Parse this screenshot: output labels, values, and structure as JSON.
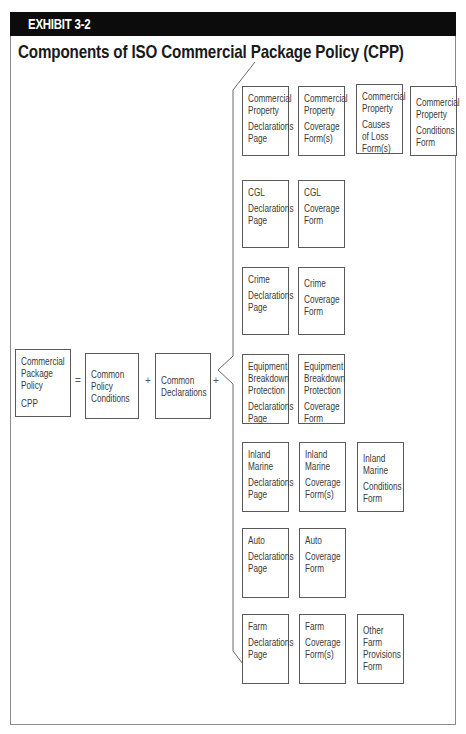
{
  "exhibit": {
    "label": "EXHIBIT 3-2"
  },
  "title": "Components of ISO Commercial Package Policy (CPP)",
  "equation": {
    "cpp": {
      "lines": [
        "Commercial",
        "Package",
        "Policy"
      ],
      "abbr": "CPP"
    },
    "equals": "=",
    "conditions": {
      "lines": [
        "Common",
        "Policy",
        "Conditions"
      ]
    },
    "plus1": "+",
    "declarations": {
      "lines": [
        "Common",
        "Declarations"
      ]
    },
    "plus2": "+"
  },
  "rows": [
    {
      "name": "commercial-property",
      "boxes": [
        {
          "head": [
            "Commercial",
            "Property"
          ],
          "body": [
            "Declarations",
            "Page"
          ]
        },
        {
          "head": [
            "Commercial",
            "Property"
          ],
          "body": [
            "Coverage",
            "Form(s)"
          ]
        },
        {
          "head": [
            "Commercial",
            "Property"
          ],
          "body": [
            "Causes",
            "of Loss",
            "Form(s)"
          ]
        },
        {
          "head": [
            "Commercial",
            "Property"
          ],
          "body": [
            "Conditions",
            "Form"
          ]
        }
      ]
    },
    {
      "name": "cgl",
      "boxes": [
        {
          "head": [
            "CGL"
          ],
          "body": [
            "Declarations",
            "Page"
          ]
        },
        {
          "head": [
            "CGL"
          ],
          "body": [
            "Coverage",
            "Form"
          ]
        }
      ]
    },
    {
      "name": "crime",
      "boxes": [
        {
          "head": [
            "Crime"
          ],
          "body": [
            "Declarations",
            "Page"
          ]
        },
        {
          "head": [
            "Crime"
          ],
          "body": [
            "Coverage",
            "Form"
          ]
        }
      ]
    },
    {
      "name": "equipment-breakdown",
      "boxes": [
        {
          "head": [
            "Equipment",
            "Breakdown",
            "Protection"
          ],
          "body": [
            "Declarations",
            "Page"
          ]
        },
        {
          "head": [
            "Equipment",
            "Breakdown",
            "Protection"
          ],
          "body": [
            "Coverage",
            "Form"
          ]
        }
      ]
    },
    {
      "name": "inland-marine",
      "boxes": [
        {
          "head": [
            "Inland",
            "Marine"
          ],
          "body": [
            "Declarations",
            "Page"
          ]
        },
        {
          "head": [
            "Inland",
            "Marine"
          ],
          "body": [
            "Coverage",
            "Form(s)"
          ]
        },
        {
          "head": [
            "Inland",
            "Marine"
          ],
          "body": [
            "Conditions",
            "Form"
          ]
        }
      ]
    },
    {
      "name": "auto",
      "boxes": [
        {
          "head": [
            "Auto"
          ],
          "body": [
            "Declarations",
            "Page"
          ]
        },
        {
          "head": [
            "Auto"
          ],
          "body": [
            "Coverage",
            "Form"
          ]
        }
      ]
    },
    {
      "name": "farm",
      "boxes": [
        {
          "head": [
            "Farm"
          ],
          "body": [
            "Declarations",
            "Page"
          ]
        },
        {
          "head": [
            "Farm"
          ],
          "body": [
            "Coverage",
            "Form(s)"
          ]
        },
        {
          "head": [],
          "body": [
            "Other",
            "Farm",
            "Provisions",
            "Form"
          ]
        }
      ]
    }
  ]
}
